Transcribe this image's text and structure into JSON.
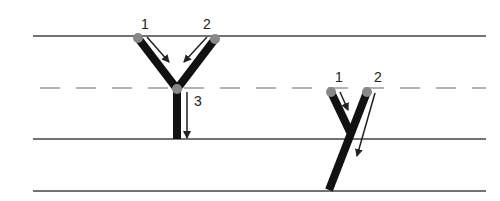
{
  "colors": {
    "line": "#444444",
    "dashed_line": "#999999",
    "stroke": "#111111",
    "dot": "#888888",
    "arrow": "#222222"
  },
  "guide_lines": [
    {
      "name": "top-line",
      "y": 36,
      "style": "solid"
    },
    {
      "name": "mid-line",
      "y": 88,
      "style": "dashed"
    },
    {
      "name": "base-line",
      "y": 139,
      "style": "solid"
    },
    {
      "name": "descender-line",
      "y": 191,
      "style": "solid"
    }
  ],
  "uppercase_Y": {
    "letter": "Y",
    "strokes": [
      {
        "number": "1",
        "label": "1"
      },
      {
        "number": "2",
        "label": "2"
      },
      {
        "number": "3",
        "label": "3"
      }
    ]
  },
  "lowercase_y": {
    "letter": "y",
    "strokes": [
      {
        "number": "1",
        "label": "1"
      },
      {
        "number": "2",
        "label": "2"
      }
    ]
  }
}
